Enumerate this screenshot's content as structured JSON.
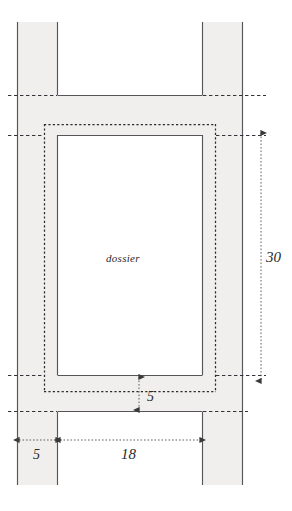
{
  "diagram": {
    "type": "technical-line-drawing",
    "canvas": {
      "width": 292,
      "height": 511
    },
    "colors": {
      "fill": "#f0efed",
      "stroke": "#4a4a4d",
      "dashed": "#2b2b2d",
      "dimension": "#4f4f52",
      "text": "#29282a",
      "background": "#ffffff"
    },
    "part_label": {
      "text": "dossier",
      "style": "italic"
    },
    "dimensions": [
      {
        "id": "height-30",
        "value": "30",
        "orientation": "vertical",
        "position": "right"
      },
      {
        "id": "gap-5",
        "value": "5",
        "orientation": "vertical",
        "position": "center-bottom"
      },
      {
        "id": "column-width-5",
        "value": "5",
        "orientation": "horizontal",
        "position": "bottom-left"
      },
      {
        "id": "inner-width-18",
        "value": "18",
        "orientation": "horizontal",
        "position": "bottom-center"
      }
    ],
    "shapes": {
      "left_column": {
        "x": 17,
        "y": 22,
        "width": 41,
        "height": 463
      },
      "right_column": {
        "x": 202,
        "y": 22,
        "width": 41,
        "height": 463
      },
      "top_bar": {
        "x": 17,
        "y": 95,
        "width": 226,
        "height": 40
      },
      "bottom_bar": {
        "x": 17,
        "y": 375,
        "width": 226,
        "height": 37
      },
      "inner_rect": {
        "x": 58,
        "y": 135,
        "width": 144,
        "height": 240
      },
      "dotted_rect": {
        "x": 44,
        "y": 124,
        "width": 172,
        "height": 268
      }
    }
  }
}
